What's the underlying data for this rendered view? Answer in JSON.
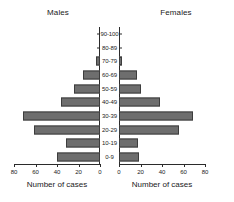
{
  "figure": {
    "left_panel_title": "Males",
    "right_panel_title": "Females",
    "axis_caption": "Number of cases",
    "bar_color": "#6e6e6e",
    "bar_edge_color": "#3d3d3d",
    "axis_color": "#2b2b2b"
  },
  "chart_data": {
    "type": "bar",
    "title": "",
    "subtitle": "",
    "orientation": "horizontal",
    "layout": "population-pyramid",
    "xlabel": "Number of cases",
    "ylabel": "",
    "grid": false,
    "legend": "none",
    "categories": [
      "0-9",
      "10-19",
      "20-29",
      "30-39",
      "40-49",
      "50-59",
      "60-69",
      "70-79",
      "80-89",
      "90-100"
    ],
    "categories_top_to_bottom": [
      "90-100",
      "80-89",
      "70-79",
      "60-69",
      "50-59",
      "40-49",
      "30-39",
      "20-29",
      "10-19",
      "0-9"
    ],
    "xlim": [
      0,
      80
    ],
    "xticks": [
      0,
      20,
      40,
      60,
      80
    ],
    "left_xticklabels": [
      "80",
      "60",
      "40",
      "20",
      "0"
    ],
    "right_xticklabels": [
      "0",
      "20",
      "40",
      "60",
      "80"
    ],
    "series": [
      {
        "name": "Males",
        "side": "left",
        "values_top_to_bottom": [
          0,
          0,
          4,
          16,
          24,
          36,
          72,
          61,
          32,
          40
        ]
      },
      {
        "name": "Females",
        "side": "right",
        "values_top_to_bottom": [
          0,
          0,
          3,
          17,
          20,
          38,
          69,
          56,
          18,
          19
        ]
      }
    ]
  }
}
